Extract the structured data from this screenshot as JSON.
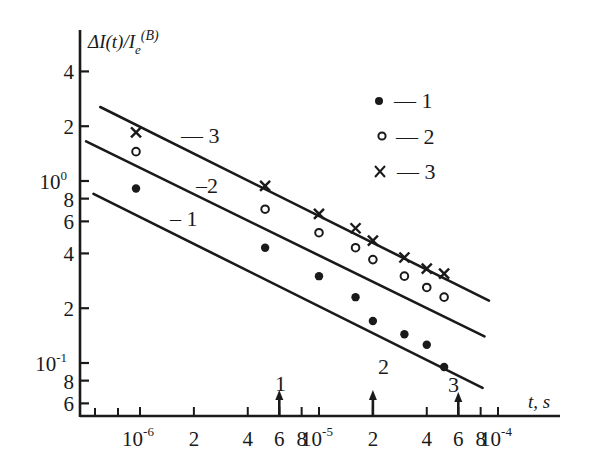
{
  "chart_data": {
    "type": "scatter",
    "title": "",
    "xlabel": "t, s",
    "ylabel": "ΔI(t)/I_e^(B)",
    "xscale": "log",
    "yscale": "log",
    "xlim": [
      4.5e-07,
      0.00013
    ],
    "ylim": [
      0.058,
      5
    ],
    "grid": false,
    "legend_position": "upper right",
    "x_ticks": [
      {
        "value": 1e-06,
        "label": "10",
        "exp": "-6"
      },
      {
        "value": 2e-06,
        "label": "2"
      },
      {
        "value": 4e-06,
        "label": "4"
      },
      {
        "value": 6e-06,
        "label": "6"
      },
      {
        "value": 8e-06,
        "label": "8"
      },
      {
        "value": 1e-05,
        "label": "10",
        "exp": "-5"
      },
      {
        "value": 2e-05,
        "label": "2"
      },
      {
        "value": 4e-05,
        "label": "4"
      },
      {
        "value": 6e-05,
        "label": "6"
      },
      {
        "value": 8e-05,
        "label": "8"
      },
      {
        "value": 0.0001,
        "label": "10",
        "exp": "-4"
      }
    ],
    "y_ticks": [
      {
        "value": 4,
        "label": "4"
      },
      {
        "value": 2,
        "label": "2"
      },
      {
        "value": 1,
        "label": "10",
        "exp": "0"
      },
      {
        "value": 0.8,
        "label": "8"
      },
      {
        "value": 0.6,
        "label": "6"
      },
      {
        "value": 0.4,
        "label": "4"
      },
      {
        "value": 0.2,
        "label": "2"
      },
      {
        "value": 0.1,
        "label": "10",
        "exp": "-1"
      },
      {
        "value": 0.08,
        "label": "8"
      },
      {
        "value": 0.06,
        "label": "6"
      }
    ],
    "series": [
      {
        "name": "1",
        "marker": "filled-circle",
        "x": [
          9.5e-07,
          5e-06,
          1e-05,
          1.6e-05,
          2e-05,
          3e-05,
          4e-05,
          5e-05
        ],
        "y": [
          0.91,
          0.43,
          0.3,
          0.23,
          0.17,
          0.144,
          0.126,
          0.095
        ],
        "fit_line": {
          "x": [
            5.5e-07,
            8.2e-05
          ],
          "y": [
            0.85,
            0.073
          ]
        },
        "line_label": "1"
      },
      {
        "name": "2",
        "marker": "open-circle",
        "x": [
          9.5e-07,
          5e-06,
          1e-05,
          1.6e-05,
          2e-05,
          3e-05,
          4e-05,
          5e-05
        ],
        "y": [
          1.45,
          0.7,
          0.52,
          0.43,
          0.37,
          0.3,
          0.26,
          0.23
        ],
        "fit_line": {
          "x": [
            5e-07,
            8.4e-05
          ],
          "y": [
            1.65,
            0.14
          ]
        },
        "line_label": "2"
      },
      {
        "name": "3",
        "marker": "x",
        "x": [
          9.5e-07,
          5e-06,
          1e-05,
          1.6e-05,
          2e-05,
          3e-05,
          4e-05,
          5e-05
        ],
        "y": [
          1.85,
          0.94,
          0.66,
          0.55,
          0.47,
          0.38,
          0.33,
          0.31
        ],
        "fit_line": {
          "x": [
            6e-07,
            8.9e-05
          ],
          "y": [
            2.55,
            0.22
          ]
        },
        "line_label": "3"
      }
    ],
    "annotations": [
      {
        "type": "arrow",
        "label": "1",
        "x": 6e-06
      },
      {
        "type": "arrow",
        "label": "2",
        "x": 2e-05
      },
      {
        "type": "arrow",
        "label": "3",
        "x": 6e-05
      }
    ],
    "legend": [
      {
        "marker": "filled-circle",
        "label": "— 1"
      },
      {
        "marker": "open-circle",
        "label": "— 2"
      },
      {
        "marker": "x",
        "label": "— 3"
      }
    ]
  },
  "labels": {
    "ylabel_main": "ΔI(t)/I",
    "ylabel_sub": "e",
    "ylabel_sup": "(B)",
    "xlabel": "t, s",
    "line1": "– 1",
    "line2": "–2",
    "line3": "— 3",
    "arrow1": "1",
    "arrow2": "2",
    "arrow3": "3",
    "legend1": "— 1",
    "legend2": "— 2",
    "legend3": "— 3"
  }
}
